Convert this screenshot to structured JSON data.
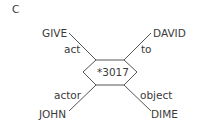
{
  "panel_label": "C",
  "center_node": "*3017",
  "nodes": {
    "top_left": "GIVE",
    "top_right": "DAVID",
    "bottom_left": "JOHN",
    "bottom_right": "DIME"
  },
  "edges": {
    "top_left": "act",
    "top_right": "to",
    "bottom_left": "actor",
    "bottom_right": "object"
  },
  "colors": {
    "line": "#555555",
    "text": "#3a3a3a"
  }
}
